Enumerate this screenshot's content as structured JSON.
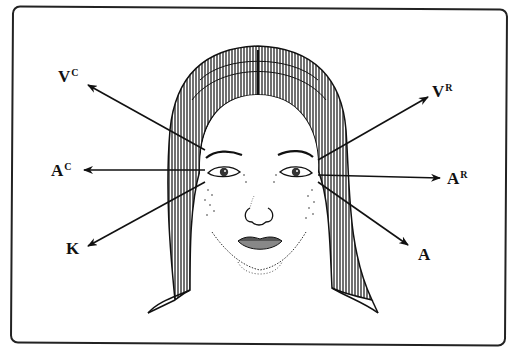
{
  "figure": {
    "arrow_color": "#111111",
    "labels": {
      "upper_left": {
        "main": "V",
        "sup": "C"
      },
      "mid_left": {
        "main": "A",
        "sup": "C"
      },
      "lower_left": {
        "main": "K",
        "sup": ""
      },
      "upper_right": {
        "main": "V",
        "sup": "R"
      },
      "mid_right": {
        "main": "A",
        "sup": "R"
      },
      "lower_right": {
        "main": "A",
        "sup": ""
      }
    }
  }
}
